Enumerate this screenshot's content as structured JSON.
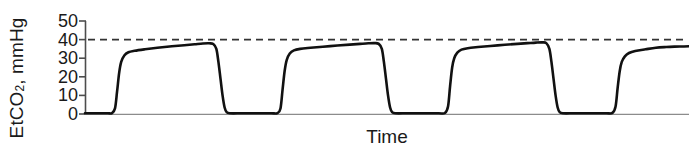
{
  "chart_data": {
    "type": "line",
    "title": "",
    "subtitle": "",
    "xlabel": "Time",
    "ylabel": "EtCO2, mmHg",
    "ylabel_prefix": "EtCO",
    "ylabel_subscript": "2",
    "ylabel_suffix": ", mmHg",
    "yticks": [
      0,
      10,
      20,
      30,
      40,
      50
    ],
    "ytick_labels": [
      "0",
      "10",
      "20",
      "30",
      "40",
      "50"
    ],
    "ylim": [
      0,
      50
    ],
    "xticks": [],
    "xtick_labels": [],
    "grid": false,
    "legend": null,
    "annotations": [
      {
        "name": "reference-line",
        "label": "",
        "value": 40,
        "style": "dashed",
        "color": "#333333",
        "orientation": "horizontal"
      }
    ],
    "series": [
      {
        "name": "EtCO2 waveform",
        "color": "#111111",
        "line_width": 2.6,
        "description": "Capnography waveform: three complete breath cycles plus a partial fourth rising at the right edge. Each cycle has a steep expiratory upstroke, a slightly rising alveolar plateau peaking near 38 mmHg, and a steep inspiratory downstroke back to a 0 mmHg baseline.",
        "peak_values": [
          38,
          38,
          38.5,
          36
        ],
        "baseline_value": 0,
        "points": [
          [
            0,
            0.4
          ],
          [
            14,
            0.4
          ],
          [
            22,
            0.4
          ],
          [
            26,
            0.5
          ],
          [
            29,
            3
          ],
          [
            31,
            12
          ],
          [
            33,
            22
          ],
          [
            35,
            28
          ],
          [
            38,
            31.5
          ],
          [
            42,
            33.2
          ],
          [
            48,
            34.0
          ],
          [
            58,
            34.8
          ],
          [
            70,
            35.6
          ],
          [
            84,
            36.4
          ],
          [
            96,
            37.0
          ],
          [
            106,
            37.5
          ],
          [
            114,
            37.9
          ],
          [
            120,
            38.0
          ],
          [
            124,
            37.6
          ],
          [
            127,
            35
          ],
          [
            129,
            28
          ],
          [
            131,
            19
          ],
          [
            133,
            10
          ],
          [
            135,
            3.5
          ],
          [
            137,
            1.0
          ],
          [
            140,
            0.4
          ],
          [
            152,
            0.4
          ],
          [
            168,
            0.4
          ],
          [
            180,
            0.4
          ],
          [
            186,
            0.5
          ],
          [
            189,
            3
          ],
          [
            191,
            13
          ],
          [
            193,
            23
          ],
          [
            195,
            29
          ],
          [
            198,
            32.5
          ],
          [
            202,
            34.2
          ],
          [
            208,
            35.0
          ],
          [
            218,
            35.6
          ],
          [
            230,
            36.2
          ],
          [
            244,
            36.8
          ],
          [
            256,
            37.3
          ],
          [
            266,
            37.7
          ],
          [
            274,
            38.0
          ],
          [
            280,
            38.1
          ],
          [
            284,
            37.7
          ],
          [
            287,
            35
          ],
          [
            289,
            28
          ],
          [
            291,
            19
          ],
          [
            293,
            10
          ],
          [
            295,
            3.5
          ],
          [
            297,
            1.0
          ],
          [
            300,
            0.4
          ],
          [
            312,
            0.4
          ],
          [
            330,
            0.4
          ],
          [
            342,
            0.4
          ],
          [
            348,
            0.5
          ],
          [
            351,
            4
          ],
          [
            353,
            15
          ],
          [
            355,
            25
          ],
          [
            357,
            30
          ],
          [
            360,
            33.0
          ],
          [
            364,
            34.6
          ],
          [
            370,
            35.4
          ],
          [
            380,
            36.0
          ],
          [
            392,
            36.6
          ],
          [
            406,
            37.2
          ],
          [
            418,
            37.7
          ],
          [
            428,
            38.1
          ],
          [
            436,
            38.4
          ],
          [
            442,
            38.5
          ],
          [
            446,
            38.1
          ],
          [
            449,
            35
          ],
          [
            451,
            28
          ],
          [
            453,
            19
          ],
          [
            455,
            10
          ],
          [
            457,
            3.5
          ],
          [
            459,
            1.0
          ],
          [
            462,
            0.4
          ],
          [
            474,
            0.4
          ],
          [
            492,
            0.4
          ],
          [
            504,
            0.4
          ],
          [
            510,
            0.6
          ],
          [
            513,
            4
          ],
          [
            515,
            14
          ],
          [
            517,
            23
          ],
          [
            519,
            28
          ],
          [
            522,
            31.0
          ],
          [
            526,
            32.8
          ],
          [
            532,
            33.9
          ],
          [
            542,
            34.8
          ],
          [
            552,
            35.6
          ],
          [
            562,
            36.0
          ],
          [
            570,
            36.2
          ],
          [
            578,
            36.3
          ],
          [
            584,
            36.4
          ]
        ]
      }
    ]
  },
  "axis": {
    "y_axis_line_color": "#4d4d4d",
    "baseline_color": "#808080"
  }
}
